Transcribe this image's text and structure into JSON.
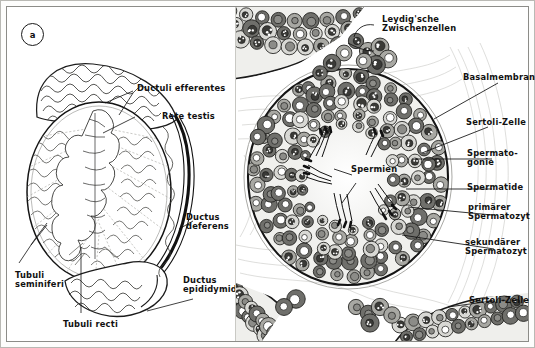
{
  "figure": {
    "domain": "anatomical-diagram",
    "panels": [
      {
        "tag": "a",
        "title": "Testis, Uebersicht (Schnitt)"
      },
      {
        "tag": "b",
        "title": "Hodenkanaelchen, Histologie"
      }
    ]
  },
  "panel_a": {
    "tag": "a",
    "labels": [
      {
        "id": "ductuli-efferentes",
        "text": "Ductuli efferentes"
      },
      {
        "id": "rete-testis",
        "text": "Rete testis"
      },
      {
        "id": "ductus-deferens",
        "text": "Ductus\ndeferens"
      },
      {
        "id": "ductus-epididymidis",
        "text": "Ductus\nepididymidis"
      },
      {
        "id": "tubuli-seminiferi",
        "text": "Tubuli\nseminiferi"
      },
      {
        "id": "tubuli-recti",
        "text": "Tubuli recti"
      }
    ]
  },
  "panel_b": {
    "tag": "b",
    "labels": [
      {
        "id": "leydigsche-zwischenzellen",
        "text": "Leydig'sche\nZwischenzellen"
      },
      {
        "id": "basalmembran",
        "text": "Basalmembran"
      },
      {
        "id": "sertoli-zelle-top",
        "text": "Sertoli-Zelle"
      },
      {
        "id": "spermatogonie",
        "text": "Spermato-\ngonie"
      },
      {
        "id": "spermatide",
        "text": "Spermatide"
      },
      {
        "id": "primaerer-spermatozyt",
        "text": "primärer\nSpermatozyt"
      },
      {
        "id": "sekundaerer-spermatozyt",
        "text": "sekundärer\nSpermatozyt"
      },
      {
        "id": "sertoli-zelle-bottom",
        "text": "Sertoli-Zelle"
      },
      {
        "id": "spermien",
        "text": "Spermien"
      }
    ]
  },
  "colors": {
    "ink": "#111111",
    "line": "#2a2a2a",
    "paper": "#ffffff",
    "frame": "#8c8c88",
    "tissue_light": "#e9e9e6",
    "tissue_mid": "#9e9e9a",
    "tissue_dark": "#4a4a47"
  }
}
